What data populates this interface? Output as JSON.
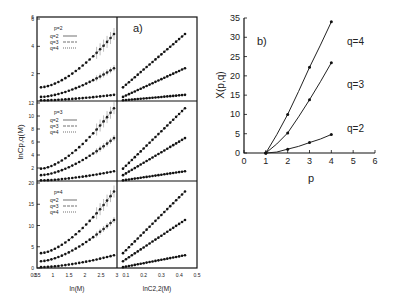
{
  "chart_data": [
    {
      "panel": "a",
      "type": "scatter",
      "label": "a)",
      "xlabel_left": "ln(M)",
      "xlabel_right": "lnC2,2(M)",
      "ylabel": "lnCp,q(M)",
      "x_left_ticks": [
        "0.5",
        "1",
        "1.5",
        "2",
        "2.5",
        "3"
      ],
      "x_left_range": [
        0.5,
        3
      ],
      "x_right_ticks": [
        "0.1",
        "0.2",
        "0.3",
        "0.4",
        "0.5"
      ],
      "x_right_range": [
        0.05,
        0.5
      ],
      "rows": [
        {
          "p": 2,
          "legend_title": "p=2",
          "legend": [
            "q=2",
            "q=3",
            "q=4"
          ],
          "yticks": [
            "2",
            "4",
            "6"
          ],
          "ylim": [
            0,
            6
          ],
          "end_values": {
            "q=2": 0.45,
            "q=3": 2.4,
            "q=4": 4.9
          },
          "start_values": {
            "q=2": 0.05,
            "q=3": 0.3,
            "q=4": 1.0
          }
        },
        {
          "p": 3,
          "legend_title": "p=3",
          "legend": [
            "q=2",
            "q=3",
            "q=4"
          ],
          "yticks": [
            "2",
            "4",
            "6",
            "8",
            "10",
            "12"
          ],
          "ylim": [
            0,
            12
          ],
          "end_values": {
            "q=2": 1.5,
            "q=3": 6.6,
            "q=4": 11.2
          },
          "start_values": {
            "q=2": 0.1,
            "q=3": 0.9,
            "q=4": 1.9
          }
        },
        {
          "p": 4,
          "legend_title": "p=4",
          "legend": [
            "q=2",
            "q=3",
            "q=4"
          ],
          "yticks": [
            "0",
            "5",
            "10",
            "15",
            "20"
          ],
          "ylim": [
            0,
            20
          ],
          "end_values": {
            "q=2": 3.0,
            "q=3": 11.3,
            "q=4": 18.0
          },
          "start_values": {
            "q=2": 0.2,
            "q=3": 1.6,
            "q=4": 3.5
          }
        }
      ]
    },
    {
      "panel": "b",
      "type": "line",
      "label": "b)",
      "xlabel": "p",
      "ylabel": "X(p,q)",
      "xlim": [
        0,
        6
      ],
      "ylim": [
        0,
        35
      ],
      "xticks": [
        "0",
        "1",
        "2",
        "3",
        "4",
        "5",
        "6"
      ],
      "yticks": [
        "0",
        "5",
        "10",
        "15",
        "20",
        "25",
        "30",
        "35"
      ],
      "x": [
        1,
        2,
        3,
        4
      ],
      "series": [
        {
          "name": "q=2",
          "values": [
            0,
            1.0,
            2.7,
            4.8
          ]
        },
        {
          "name": "q=3",
          "values": [
            0,
            5.2,
            13.8,
            23.4
          ]
        },
        {
          "name": "q=4",
          "values": [
            0,
            10.0,
            22.2,
            34.0
          ]
        }
      ]
    }
  ]
}
